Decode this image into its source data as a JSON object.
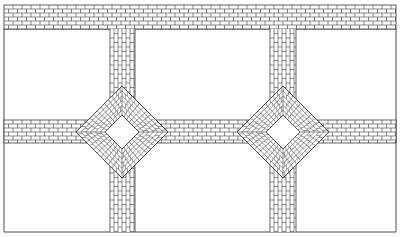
{
  "diagram": {
    "type": "brick paving pattern plan",
    "canvas": {
      "width": 400,
      "height": 237
    },
    "colors": {
      "background": "#ffffff",
      "line": "#3a3a3a",
      "fill": "#ffffff"
    },
    "frame": {
      "x1": 4,
      "y1": 29,
      "x2": 396,
      "y2": 232
    },
    "top_band": {
      "x1": 4,
      "y1": 5,
      "x2": 396,
      "y2": 29,
      "bond": "running-horizontal",
      "brick_w": 9,
      "brick_h": 4
    },
    "horizontal_band": {
      "x1": 4,
      "y1": 120,
      "x2": 396,
      "y2": 143,
      "bond": "running-horizontal",
      "brick_w": 9,
      "brick_h": 4
    },
    "vertical_columns": [
      {
        "x1": 110,
        "x2": 135,
        "y1": 29,
        "y2": 232,
        "bond": "running-vertical",
        "brick_w": 4,
        "brick_h": 9
      },
      {
        "x1": 270,
        "x2": 296,
        "y1": 29,
        "y2": 232,
        "bond": "running-vertical",
        "brick_w": 4,
        "brick_h": 9
      }
    ],
    "diamonds": [
      {
        "cx": 122,
        "cy": 132,
        "outer_half": 46,
        "inner_half": 17,
        "bond": "diagonal-herringbone-ring"
      },
      {
        "cx": 283,
        "cy": 132,
        "outer_half": 46,
        "inner_half": 17,
        "bond": "diagonal-herringbone-ring"
      }
    ]
  }
}
